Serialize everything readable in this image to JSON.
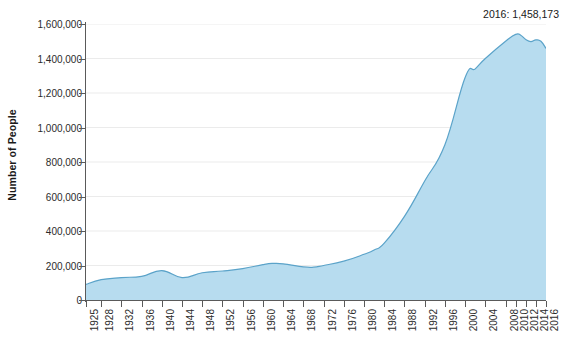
{
  "chart_data": {
    "type": "area",
    "title": "",
    "xlabel": "",
    "ylabel": "Number of People",
    "ylim": [
      0,
      1600000
    ],
    "xlim": [
      1925,
      2016
    ],
    "grid": true,
    "legend": "none",
    "annotation": "2016: 1,458,173",
    "y_ticks": [
      0,
      200000,
      400000,
      600000,
      800000,
      1000000,
      1200000,
      1400000,
      1600000
    ],
    "y_tick_labels": [
      "0",
      "200,000",
      "400,000",
      "600,000",
      "800,000",
      "1,000,000",
      "1,200,000",
      "1,400,000",
      "1,600,000"
    ],
    "x_ticks": [
      1925,
      1928,
      1932,
      1936,
      1940,
      1944,
      1948,
      1952,
      1956,
      1960,
      1964,
      1968,
      1972,
      1976,
      1980,
      1984,
      1988,
      1992,
      1996,
      2000,
      2004,
      2008,
      2010,
      2012,
      2014,
      2016
    ],
    "x_tick_labels": [
      "1925",
      "1928",
      "1932",
      "1936",
      "1940",
      "1944",
      "1948",
      "1952",
      "1956",
      "1960",
      "1964",
      "1968",
      "1972",
      "1976",
      "1980",
      "1984",
      "1988",
      "1992",
      "1996",
      "2000",
      "2004",
      "2008",
      "2010",
      "2012",
      "2014",
      "2016"
    ],
    "x": [
      1925,
      1928,
      1932,
      1936,
      1940,
      1944,
      1948,
      1952,
      1956,
      1960,
      1962,
      1964,
      1968,
      1970,
      1972,
      1976,
      1980,
      1982,
      1984,
      1988,
      1992,
      1996,
      2000,
      2002,
      2004,
      2008,
      2010,
      2011,
      2012,
      2013,
      2014,
      2015,
      2016
    ],
    "values": [
      90000,
      118000,
      130000,
      137000,
      170000,
      130000,
      158000,
      168000,
      182000,
      205000,
      212000,
      210000,
      192000,
      190000,
      200000,
      225000,
      265000,
      290000,
      330000,
      485000,
      690000,
      900000,
      1290000,
      1340000,
      1400000,
      1500000,
      1540000,
      1535000,
      1510000,
      1498000,
      1508000,
      1500000,
      1458173
    ],
    "series": [
      {
        "name": "Number of People",
        "fill_color": "#b7dcef",
        "line_color": "#5ba3c9",
        "values": [
          90000,
          118000,
          130000,
          137000,
          170000,
          130000,
          158000,
          168000,
          182000,
          205000,
          212000,
          210000,
          192000,
          190000,
          200000,
          225000,
          265000,
          290000,
          330000,
          485000,
          690000,
          900000,
          1290000,
          1340000,
          1400000,
          1500000,
          1540000,
          1535000,
          1510000,
          1498000,
          1508000,
          1500000,
          1458173
        ]
      }
    ],
    "colors": {
      "fill": "#b7dcef",
      "line": "#5ba3c9",
      "grid": "#ebebeb",
      "axis": "#5a5a5a",
      "text": "#2b2b2b",
      "background": "#ffffff"
    }
  }
}
